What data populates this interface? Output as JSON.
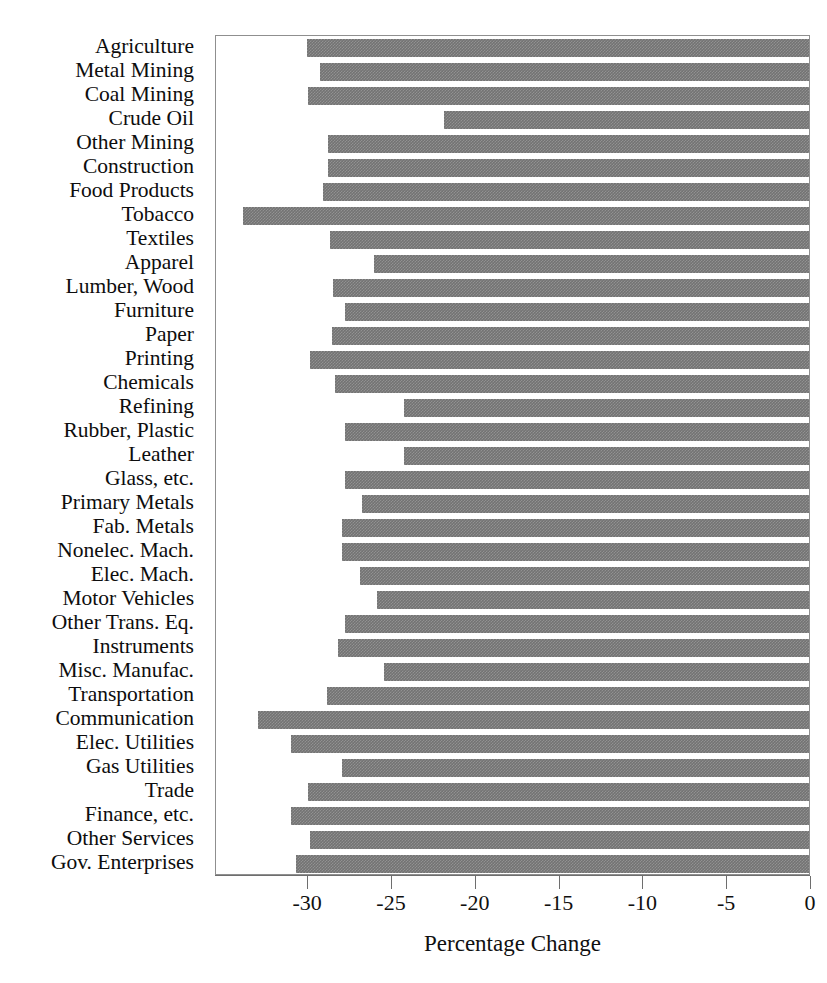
{
  "chart_data": {
    "type": "bar",
    "orientation": "horizontal",
    "title": "",
    "xlabel": "Percentage Change",
    "ylabel": "",
    "xlim": [
      -35.5,
      0.0
    ],
    "xticks": [
      -30,
      -25,
      -20,
      -15,
      -10,
      -5,
      0
    ],
    "xtick_labels": [
      "-30",
      "-25",
      "-20",
      "-15",
      "-10",
      "-5",
      "0"
    ],
    "grid": false,
    "legend": "none",
    "bar_color": "#737373",
    "categories": [
      "Agriculture",
      "Metal Mining",
      "Coal Mining",
      "Crude Oil",
      "Other Mining",
      "Construction",
      "Food Products",
      "Tobacco",
      "Textiles",
      "Apparel",
      "Lumber, Wood",
      "Furniture",
      "Paper",
      "Printing",
      "Chemicals",
      "Refining",
      "Rubber, Plastic",
      "Leather",
      "Glass, etc.",
      "Primary Metals",
      "Fab. Metals",
      "Nonelec. Mach.",
      "Elec. Mach.",
      "Motor Vehicles",
      "Other Trans. Eq.",
      "Instruments",
      "Misc. Manufac.",
      "Transportation",
      "Communication",
      "Elec. Utilities",
      "Gas Utilities",
      "Trade",
      "Finance, etc.",
      "Other Services",
      "Gov. Enterprises"
    ],
    "values": [
      -30.1,
      -29.3,
      -30.0,
      -21.9,
      -28.8,
      -28.8,
      -29.1,
      -33.9,
      -28.7,
      -26.1,
      -28.5,
      -27.8,
      -28.6,
      -29.9,
      -28.4,
      -24.3,
      -27.8,
      -24.3,
      -27.8,
      -26.8,
      -28.0,
      -28.0,
      -26.9,
      -25.9,
      -27.8,
      -28.2,
      -25.5,
      -28.9,
      -33.0,
      -31.0,
      -28.0,
      -30.0,
      -31.0,
      -29.9,
      -30.7
    ]
  }
}
